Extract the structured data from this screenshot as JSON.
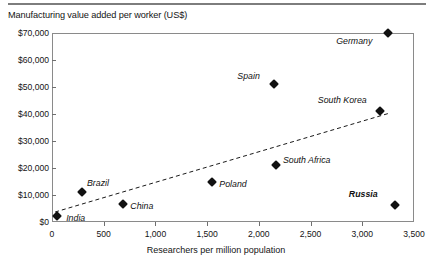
{
  "chart_data": {
    "type": "scatter",
    "title": "Manufacturing value added per worker (US$)",
    "xlabel": "Researchers per million population",
    "ylabel": "",
    "xlim": [
      0,
      3500
    ],
    "ylim": [
      0,
      70000
    ],
    "grid": false,
    "legend": "none",
    "x_ticks": [
      "0",
      "500",
      "1,000",
      "1,500",
      "2,000",
      "2,500",
      "3,000",
      "3,500"
    ],
    "x_tick_values": [
      0,
      500,
      1000,
      1500,
      2000,
      2500,
      3000,
      3500
    ],
    "y_ticks": [
      "$0",
      "$10,000",
      "$20,000",
      "$30,000",
      "$40,000",
      "$50,000",
      "$60,000",
      "$70,000"
    ],
    "y_tick_values": [
      0,
      10000,
      20000,
      30000,
      40000,
      50000,
      60000,
      70000
    ],
    "points": [
      {
        "label": "India",
        "x": 50,
        "y": 2200,
        "label_dx": 9,
        "label_dy": 3,
        "bold": false
      },
      {
        "label": "Brazil",
        "x": 290,
        "y": 11000,
        "label_dx": 5,
        "label_dy": -8,
        "bold": false
      },
      {
        "label": "China",
        "x": 690,
        "y": 6700,
        "label_dx": 7,
        "label_dy": 3,
        "bold": false
      },
      {
        "label": "Poland",
        "x": 1550,
        "y": 15000,
        "label_dx": 7,
        "label_dy": 3,
        "bold": false
      },
      {
        "label": "South Africa",
        "x": 2165,
        "y": 21000,
        "label_dx": 7,
        "label_dy": -4,
        "bold": false
      },
      {
        "label": "Spain",
        "x": 2150,
        "y": 51000,
        "label_dx": -37,
        "label_dy": -7,
        "bold": false
      },
      {
        "label": "South Korea",
        "x": 3170,
        "y": 41000,
        "label_dx": -62,
        "label_dy": -10,
        "bold": false
      },
      {
        "label": "Germany",
        "x": 3250,
        "y": 70000,
        "label_dx": -52,
        "label_dy": 9,
        "bold": false
      },
      {
        "label": "Russia",
        "x": 3315,
        "y": 6300,
        "label_dx": -46,
        "label_dy": -10,
        "bold": true
      }
    ],
    "trendline": {
      "style": "dashed",
      "x0": 30,
      "y0": 3700,
      "x1": 3270,
      "y1": 40400
    }
  }
}
